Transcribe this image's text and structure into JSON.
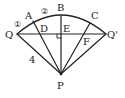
{
  "diagram": {
    "type": "geometry-sector",
    "colors": {
      "stroke": "#222222",
      "background": "#ffffff"
    },
    "points": {
      "P": {
        "label": "P",
        "x": 61,
        "y": 74,
        "lx": 57,
        "ly": 89
      },
      "Q": {
        "label": "Q",
        "x": 17,
        "y": 34,
        "lx": 5,
        "ly": 38
      },
      "Q_prime": {
        "label": "Q'",
        "x": 106,
        "y": 34,
        "lx": 107,
        "ly": 38
      },
      "A": {
        "label": "A",
        "x": 33,
        "y": 21,
        "lx": 25,
        "ly": 19
      },
      "B": {
        "label": "B",
        "x": 61,
        "y": 16,
        "lx": 57,
        "ly": 11
      },
      "C": {
        "label": "C",
        "x": 90,
        "y": 23,
        "lx": 91,
        "ly": 19
      },
      "D": {
        "label": "D",
        "x": 39,
        "y": 34,
        "lx": 40,
        "ly": 32
      },
      "E": {
        "label": "E",
        "x": 61,
        "y": 34,
        "lx": 63,
        "ly": 32
      },
      "F": {
        "label": "F",
        "x": 85,
        "y": 34,
        "lx": 83,
        "ly": 45
      }
    },
    "annotations": {
      "circle1": {
        "text": "①",
        "x": 14,
        "y": 27
      },
      "circle2": {
        "text": "②",
        "x": 41,
        "y": 14
      },
      "length_PQ": {
        "text": "4",
        "x": 29,
        "y": 63
      }
    },
    "segments": [
      [
        "P",
        "Q"
      ],
      [
        "P",
        "Q_prime"
      ],
      [
        "P",
        "A"
      ],
      [
        "P",
        "B"
      ],
      [
        "P",
        "C"
      ],
      [
        "Q",
        "Q_prime"
      ]
    ],
    "right_angle_at": "E"
  }
}
